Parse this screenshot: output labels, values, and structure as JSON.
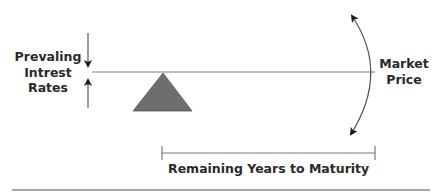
{
  "diagram": {
    "left_label": [
      "Prevaling",
      "Intrest",
      "Rates"
    ],
    "right_label": [
      "Market",
      "Price"
    ],
    "bottom_label": "Remaining Years to Maturity",
    "colors": {
      "line": "#7a7a7a",
      "fulcrum": "#6e6e6e",
      "text": "#2a2a2a",
      "arrow": "#1a1a1a"
    },
    "elements": {
      "lever": "horizontal seesaw beam",
      "fulcrum": "triangle",
      "interest_rate_arrows": [
        "down-arrow",
        "up-arrow"
      ],
      "price_arc": "double-headed curved arrow",
      "maturity_range": "bracketed horizontal span"
    }
  }
}
